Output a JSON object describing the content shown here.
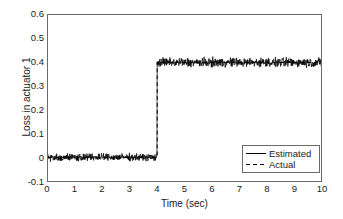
{
  "chart_data": {
    "type": "line",
    "title": "",
    "xlabel": "Time (sec)",
    "ylabel": "Loss in actuator 1",
    "xlim": [
      0,
      10
    ],
    "ylim": [
      -0.1,
      0.6
    ],
    "xticks": [
      "0",
      "1",
      "2",
      "3",
      "4",
      "5",
      "6",
      "7",
      "8",
      "9",
      "10"
    ],
    "xtick_values": [
      0,
      1,
      2,
      3,
      4,
      5,
      6,
      7,
      8,
      9,
      10
    ],
    "yticks": [
      "0.6",
      "0.5",
      "0.4",
      "0.3",
      "0.2",
      "0.1",
      "0",
      "-0.1"
    ],
    "ytick_values": [
      0.6,
      0.5,
      0.4,
      0.3,
      0.2,
      0.1,
      0,
      -0.1
    ],
    "grid": false,
    "legend_position": "lower right",
    "legend": [
      {
        "name": "Estimated",
        "style": "solid",
        "color": "#000000"
      },
      {
        "name": "Actual",
        "style": "dashed",
        "color": "#000000"
      }
    ],
    "series": [
      {
        "name": "Estimated",
        "style": "solid",
        "color": "#000000",
        "description": "Noisy signal, mean 0 for t in [0,4), step to mean 0.40 for t in [4,10]; noise std approx 0.012 (low segment) and 0.013 (high segment)",
        "step_time": 4.0,
        "level_before": 0.0,
        "level_after": 0.4,
        "noise_amplitude_before": 0.022,
        "noise_amplitude_after": 0.028
      },
      {
        "name": "Actual",
        "style": "dashed",
        "color": "#000000",
        "description": "Ideal step: 0 for t in [0,4), 0.40 for t in [4,10]; hidden beneath the estimated trace",
        "step_time": 4.0,
        "level_before": 0.0,
        "level_after": 0.4
      }
    ],
    "axis_color": "#6b6b6b",
    "background": "#ffffff"
  }
}
